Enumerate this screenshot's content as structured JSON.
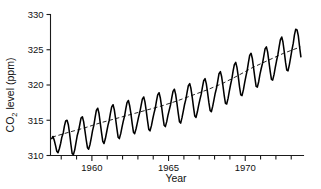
{
  "chart_data": {
    "type": "line",
    "title": "",
    "xlabel": "Year",
    "ylabel": "CO2 level (ppm)",
    "ylabel_parts": {
      "pre": "CO",
      "sub": "2",
      "post": " level (ppm)"
    },
    "xlim": [
      1957.3,
      1973.8
    ],
    "ylim": [
      310,
      330
    ],
    "xticks_major": [
      1960,
      1965,
      1970
    ],
    "xticklabels": [
      "1960",
      "1965",
      "1970"
    ],
    "xticks_minor": [
      1958,
      1959,
      1960,
      1961,
      1962,
      1963,
      1964,
      1965,
      1966,
      1967,
      1968,
      1969,
      1970,
      1971,
      1972,
      1973
    ],
    "yticks": [
      310,
      315,
      320,
      325,
      330
    ],
    "yticklabels": [
      "310",
      "315",
      "320",
      "325",
      "330"
    ],
    "grid": false,
    "legend": "none",
    "series": [
      {
        "name": "Monthly mean CO2",
        "style": "solid",
        "color": "#000000",
        "description": "Monthly atmospheric CO2 concentration with seasonal sawtooth oscillation",
        "x": [
          1957.38,
          1957.46,
          1957.54,
          1957.63,
          1957.71,
          1957.79,
          1957.88,
          1957.96,
          1958.04,
          1958.13,
          1958.21,
          1958.29,
          1958.38,
          1958.46,
          1958.54,
          1958.63,
          1958.71,
          1958.79,
          1958.88,
          1958.96,
          1959.04,
          1959.13,
          1959.21,
          1959.29,
          1959.38,
          1959.46,
          1959.54,
          1959.63,
          1959.71,
          1959.79,
          1959.88,
          1959.96,
          1960.04,
          1960.13,
          1960.21,
          1960.29,
          1960.38,
          1960.46,
          1960.54,
          1960.63,
          1960.71,
          1960.79,
          1960.88,
          1960.96,
          1961.04,
          1961.13,
          1961.21,
          1961.29,
          1961.38,
          1961.46,
          1961.54,
          1961.63,
          1961.71,
          1961.79,
          1961.88,
          1961.96,
          1962.04,
          1962.13,
          1962.21,
          1962.29,
          1962.38,
          1962.46,
          1962.54,
          1962.63,
          1962.71,
          1962.79,
          1962.88,
          1962.96,
          1963.04,
          1963.13,
          1963.21,
          1963.29,
          1963.38,
          1963.46,
          1963.54,
          1963.63,
          1963.71,
          1963.79,
          1963.88,
          1963.96,
          1964.04,
          1964.13,
          1964.21,
          1964.29,
          1964.38,
          1964.46,
          1964.54,
          1964.63,
          1964.71,
          1964.79,
          1964.88,
          1964.96,
          1965.04,
          1965.13,
          1965.21,
          1965.29,
          1965.38,
          1965.46,
          1965.54,
          1965.63,
          1965.71,
          1965.79,
          1965.88,
          1965.96,
          1966.04,
          1966.13,
          1966.21,
          1966.29,
          1966.38,
          1966.46,
          1966.54,
          1966.63,
          1966.71,
          1966.79,
          1966.88,
          1966.96,
          1967.04,
          1967.13,
          1967.21,
          1967.29,
          1967.38,
          1967.46,
          1967.54,
          1967.63,
          1967.71,
          1967.79,
          1967.88,
          1967.96,
          1968.04,
          1968.13,
          1968.21,
          1968.29,
          1968.38,
          1968.46,
          1968.54,
          1968.63,
          1968.71,
          1968.79,
          1968.88,
          1968.96,
          1969.04,
          1969.13,
          1969.21,
          1969.29,
          1969.38,
          1969.46,
          1969.54,
          1969.63,
          1969.71,
          1969.79,
          1969.88,
          1969.96,
          1970.04,
          1970.13,
          1970.21,
          1970.29,
          1970.38,
          1970.46,
          1970.54,
          1970.63,
          1970.71,
          1970.79,
          1970.88,
          1970.96,
          1971.04,
          1971.13,
          1971.21,
          1971.29,
          1971.38,
          1971.46,
          1971.54,
          1971.63,
          1971.71,
          1971.79,
          1971.88,
          1971.96,
          1972.04,
          1972.13,
          1972.21,
          1972.29,
          1972.38,
          1972.46,
          1972.54,
          1972.63,
          1972.71,
          1972.79,
          1972.88,
          1972.96,
          1973.04,
          1973.13,
          1973.21,
          1973.29,
          1973.38,
          1973.46,
          1973.54,
          1973.63
        ],
        "y": [
          312.4,
          312.7,
          312.2,
          311.4,
          310.6,
          310.4,
          311.0,
          311.7,
          312.6,
          313.2,
          314.2,
          314.9,
          315.0,
          314.4,
          313.2,
          311.6,
          310.3,
          310.1,
          310.8,
          311.8,
          312.8,
          313.5,
          314.4,
          315.3,
          315.5,
          314.8,
          313.6,
          312.2,
          311.1,
          310.9,
          311.6,
          312.5,
          313.5,
          314.3,
          315.4,
          316.4,
          316.7,
          316.0,
          314.7,
          313.2,
          312.0,
          311.7,
          312.4,
          313.3,
          314.2,
          315.0,
          316.0,
          316.9,
          317.2,
          316.5,
          315.3,
          313.8,
          312.6,
          312.4,
          313.1,
          314.0,
          314.8,
          315.6,
          316.6,
          317.5,
          317.8,
          317.1,
          316.0,
          314.5,
          313.3,
          313.1,
          313.8,
          314.6,
          315.4,
          316.2,
          317.1,
          318.0,
          318.3,
          317.6,
          316.4,
          314.9,
          313.7,
          313.5,
          314.2,
          315.1,
          315.9,
          316.7,
          317.7,
          318.6,
          318.9,
          318.2,
          317.0,
          315.5,
          314.3,
          314.1,
          314.8,
          315.7,
          316.4,
          317.2,
          318.2,
          319.1,
          319.4,
          318.7,
          317.5,
          316.0,
          314.8,
          314.6,
          315.4,
          316.3,
          317.2,
          318.0,
          319.0,
          319.9,
          320.2,
          319.5,
          318.3,
          316.8,
          315.6,
          315.4,
          316.2,
          317.1,
          317.9,
          318.7,
          319.7,
          320.6,
          320.9,
          320.2,
          319.0,
          317.5,
          316.4,
          316.2,
          317.0,
          317.9,
          318.8,
          319.6,
          320.6,
          321.6,
          321.9,
          321.2,
          320.0,
          318.5,
          317.4,
          317.3,
          318.1,
          319.1,
          320.0,
          320.9,
          322.0,
          322.9,
          323.2,
          322.5,
          321.3,
          319.7,
          318.6,
          318.5,
          319.3,
          320.3,
          321.2,
          322.1,
          323.2,
          324.2,
          324.5,
          323.8,
          322.5,
          321.0,
          319.8,
          319.7,
          320.5,
          321.5,
          322.3,
          323.1,
          324.1,
          325.1,
          325.4,
          324.7,
          323.4,
          321.9,
          320.8,
          320.7,
          321.5,
          322.5,
          323.4,
          324.3,
          325.4,
          326.4,
          326.8,
          326.1,
          324.8,
          323.2,
          322.1,
          322.0,
          322.9,
          323.9,
          324.9,
          325.9,
          327.1,
          327.9,
          327.8,
          327.0,
          325.5,
          324.0
        ]
      },
      {
        "name": "Long-term trend",
        "style": "dashed",
        "color": "#000000",
        "description": "Smoothed annual-mean trend line through the seasonal cycle",
        "x": [
          1957.4,
          1958.5,
          1959.5,
          1960.5,
          1961.5,
          1962.5,
          1963.5,
          1964.5,
          1965.5,
          1966.5,
          1967.5,
          1968.5,
          1969.5,
          1970.5,
          1971.5,
          1972.5,
          1973.6
        ],
        "y": [
          312.6,
          313.3,
          313.9,
          314.6,
          315.2,
          315.8,
          316.4,
          317.0,
          317.7,
          318.5,
          319.3,
          320.2,
          321.3,
          322.5,
          323.5,
          324.5,
          325.4
        ]
      }
    ]
  },
  "axes": {
    "y_axis_name": "co2-level-axis",
    "x_axis_name": "year-axis"
  }
}
